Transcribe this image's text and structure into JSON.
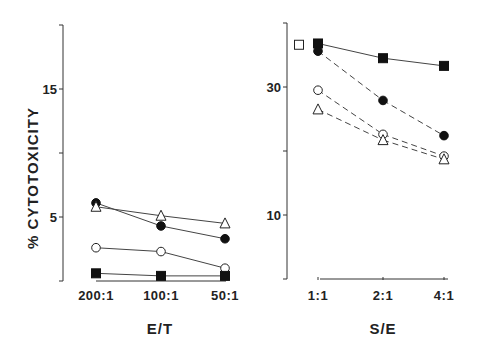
{
  "chart_data": [
    {
      "type": "line",
      "title": "",
      "xlabel": "E/T",
      "ylabel": "% CYTOTOXICITY",
      "ylim": [
        0,
        20
      ],
      "yticks": [
        0,
        5,
        10,
        15,
        20
      ],
      "ytick_labels": [
        "",
        "5",
        "",
        "15",
        ""
      ],
      "categories": [
        "200:1",
        "100:1",
        "50:1"
      ],
      "grid": false,
      "series": [
        {
          "name": "filled-circle",
          "marker": "filled-circle",
          "line": "solid",
          "values": [
            6.1,
            4.3,
            3.3
          ]
        },
        {
          "name": "open-triangle",
          "marker": "open-triangle",
          "line": "solid",
          "values": [
            5.8,
            5.1,
            4.5
          ]
        },
        {
          "name": "open-circle",
          "marker": "open-circle",
          "line": "solid",
          "values": [
            2.6,
            2.3,
            1.0
          ]
        },
        {
          "name": "filled-square",
          "marker": "filled-square",
          "line": "solid",
          "values": [
            0.6,
            0.4,
            0.4
          ]
        }
      ]
    },
    {
      "type": "line",
      "title": "",
      "xlabel": "S/E",
      "ylabel": "",
      "ylim": [
        0,
        40
      ],
      "yticks": [
        0,
        10,
        20,
        30,
        40
      ],
      "ytick_labels": [
        "",
        "10",
        "",
        "30",
        ""
      ],
      "categories": [
        "1:1",
        "2:1",
        "4:1"
      ],
      "grid": false,
      "control_point": {
        "name": "open-square",
        "marker": "open-square",
        "value": 36.6
      },
      "series": [
        {
          "name": "filled-square",
          "marker": "filled-square",
          "line": "solid",
          "values": [
            36.8,
            34.5,
            33.3
          ]
        },
        {
          "name": "filled-circle",
          "marker": "filled-circle",
          "line": "dashed",
          "values": [
            35.6,
            27.9,
            22.4
          ]
        },
        {
          "name": "open-circle",
          "marker": "open-circle",
          "line": "dashed",
          "values": [
            29.5,
            22.6,
            19.2
          ]
        },
        {
          "name": "open-triangle",
          "marker": "open-triangle",
          "line": "dashed",
          "values": [
            26.5,
            21.7,
            18.7
          ]
        }
      ]
    }
  ]
}
